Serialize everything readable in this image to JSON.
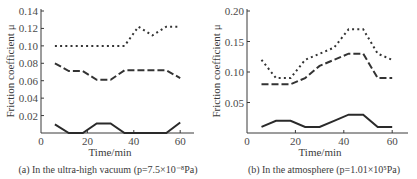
{
  "chart_data": [
    {
      "type": "line",
      "panel": "a",
      "title": "",
      "caption": "(a) In the ultra-high vacuum (p=7.5×10⁻⁸Pa)",
      "xlabel": "Time/min",
      "ylabel": "Friction coefficient μ",
      "xlim": [
        0,
        65
      ],
      "ylim": [
        0,
        0.14
      ],
      "xticks": [
        0,
        20,
        40,
        60
      ],
      "xtick_labels": [
        "0",
        "20",
        "40",
        "60"
      ],
      "yticks": [
        0.02,
        0.04,
        0.06,
        0.08,
        0.1,
        0.12,
        0.14
      ],
      "ytick_labels": [
        "0.02",
        "0.04",
        "0.06",
        "0.08",
        "0.10",
        "0.12",
        "0.14"
      ],
      "grid": false,
      "legend": null,
      "x": [
        6,
        12,
        18,
        24,
        30,
        36,
        42,
        48,
        54,
        60
      ],
      "series": [
        {
          "name": "dotted",
          "style": "dotted",
          "values": [
            0.1,
            0.1,
            0.1,
            0.1,
            0.1,
            0.1,
            0.122,
            0.112,
            0.122,
            0.122
          ]
        },
        {
          "name": "dashed",
          "style": "dashed",
          "values": [
            0.08,
            0.071,
            0.071,
            0.061,
            0.061,
            0.072,
            0.072,
            0.072,
            0.072,
            0.063
          ]
        },
        {
          "name": "solid",
          "style": "solid",
          "values": [
            0.01,
            0.0,
            0.0,
            0.011,
            0.011,
            0.0,
            0.0,
            0.0,
            0.0,
            0.012
          ]
        }
      ]
    },
    {
      "type": "line",
      "panel": "b",
      "title": "",
      "caption": "(b) In the atmosphere (p=1.01×10⁵Pa)",
      "xlabel": "Time/min",
      "ylabel": "Friction coefficient μ",
      "xlim": [
        0,
        66
      ],
      "ylim": [
        0,
        0.2
      ],
      "xticks": [
        0,
        20,
        40,
        60
      ],
      "xtick_labels": [
        "0",
        "20",
        "40",
        "60"
      ],
      "yticks": [
        0.05,
        0.1,
        0.15,
        0.2
      ],
      "ytick_labels": [
        "0.05",
        "0.10",
        "0.15",
        "0.20"
      ],
      "grid": false,
      "legend": null,
      "x": [
        6,
        12,
        18,
        24,
        30,
        36,
        42,
        48,
        54,
        60
      ],
      "series": [
        {
          "name": "dotted",
          "style": "dotted",
          "values": [
            0.12,
            0.09,
            0.09,
            0.12,
            0.13,
            0.14,
            0.17,
            0.17,
            0.13,
            0.12
          ]
        },
        {
          "name": "dashed",
          "style": "dashed",
          "values": [
            0.08,
            0.08,
            0.08,
            0.09,
            0.11,
            0.12,
            0.13,
            0.13,
            0.09,
            0.09
          ]
        },
        {
          "name": "solid",
          "style": "solid",
          "values": [
            0.01,
            0.02,
            0.02,
            0.01,
            0.01,
            0.02,
            0.03,
            0.03,
            0.01,
            0.01
          ]
        }
      ]
    }
  ],
  "layout": {
    "panels": [
      {
        "x0": 41,
        "y0": 133,
        "xAxisEnd": 194,
        "yTop": 9,
        "pxPerX": 2.32,
        "pxPerY": 871.4,
        "ylabelX": 14,
        "xlabelX": 110,
        "captionX": 108
      },
      {
        "x0": 247,
        "y0": 133,
        "xAxisEnd": 408,
        "yTop": 9,
        "pxPerX": 2.42,
        "pxPerY": 610,
        "ylabelX": 220,
        "xlabelX": 320,
        "captionX": 324
      }
    ]
  }
}
